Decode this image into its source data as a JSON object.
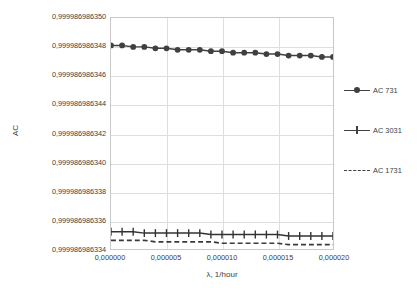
{
  "chart_data": {
    "type": "line",
    "title": "",
    "xlabel": "λ, 1/hour",
    "ylabel": "AC",
    "grid": true,
    "legend_position": "right",
    "xlim": [
      0.0,
      2e-05
    ],
    "ylim": [
      0.999986986334,
      0.99998698635
    ],
    "xtick_labels": [
      "0,000000",
      "0,000005",
      "0,000010",
      "0,000015",
      "0,000020"
    ],
    "xticks": [
      0.0,
      5e-06,
      1e-05,
      1.5e-05,
      2e-05
    ],
    "ytick_labels": [
      "0,999986986350",
      "0,999986986348",
      "0,999986986346",
      "0,999986986344",
      "0,999986986342",
      "0,999986986340",
      "0,999986986338",
      "0,999986986336",
      "0,999986986334"
    ],
    "yticks": [
      0.99998698635,
      0.999986986348,
      0.999986986346,
      0.999986986344,
      0.999986986342,
      0.99998698634,
      0.999986986338,
      0.999986986336,
      0.999986986334
    ],
    "x": [
      0.0,
      1e-06,
      2e-06,
      3e-06,
      4e-06,
      5e-06,
      6e-06,
      7e-06,
      8e-06,
      9e-06,
      1e-05,
      1.1e-05,
      1.2e-05,
      1.3e-05,
      1.4e-05,
      1.5e-05,
      1.6e-05,
      1.7e-05,
      1.8e-05,
      1.9e-05,
      2e-05
    ],
    "series": [
      {
        "name": "AC 731",
        "marker": "circle",
        "linestyle": "solid",
        "color": "#404040",
        "values": [
          0.9999869863481,
          0.9999869863481,
          0.999986986348,
          0.999986986348,
          0.9999869863479,
          0.9999869863479,
          0.9999869863478,
          0.9999869863478,
          0.9999869863478,
          0.9999869863477,
          0.9999869863477,
          0.9999869863476,
          0.9999869863476,
          0.9999869863476,
          0.9999869863475,
          0.9999869863475,
          0.9999869863474,
          0.9999869863474,
          0.9999869863474,
          0.9999869863473,
          0.9999869863473
        ]
      },
      {
        "name": "AC 3031",
        "marker": "plus",
        "linestyle": "solid",
        "color": "#333333",
        "values": [
          0.9999869863352,
          0.9999869863352,
          0.9999869863352,
          0.9999869863351,
          0.9999869863351,
          0.9999869863351,
          0.9999869863351,
          0.9999869863351,
          0.9999869863351,
          0.999986986335,
          0.999986986335,
          0.999986986335,
          0.999986986335,
          0.999986986335,
          0.999986986335,
          0.999986986335,
          0.9999869863349,
          0.9999869863349,
          0.9999869863349,
          0.9999869863349,
          0.9999869863349
        ]
      },
      {
        "name": "AC 1731",
        "marker": "none",
        "linestyle": "dashed",
        "color": "#3a3a3a",
        "values": [
          0.9999869863346,
          0.9999869863346,
          0.9999869863346,
          0.9999869863346,
          0.9999869863345,
          0.9999869863345,
          0.9999869863345,
          0.9999869863345,
          0.9999869863345,
          0.9999869863345,
          0.9999869863344,
          0.9999869863344,
          0.9999869863344,
          0.9999869863344,
          0.9999869863344,
          0.9999869863344,
          0.9999869863343,
          0.9999869863343,
          0.9999869863343,
          0.9999869863343,
          0.9999869863343
        ]
      }
    ]
  },
  "legend": {
    "items": [
      {
        "label": "AC 731"
      },
      {
        "label": "AC 3031"
      },
      {
        "label": "AC 1731"
      }
    ]
  }
}
